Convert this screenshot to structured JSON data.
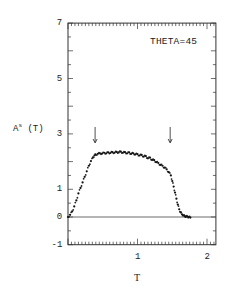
{
  "chart_data": {
    "type": "scatter",
    "title": "",
    "annotation": "THETA=45",
    "xlabel": "T",
    "ylabel": "A^s (T)",
    "ylabel_base": "A",
    "ylabel_sup": "s",
    "ylabel_arg": " (T)",
    "xlim": [
      0,
      2.2
    ],
    "ylim": [
      -1,
      7
    ],
    "xticks": [
      1,
      2
    ],
    "xtick_labels": [
      "1",
      "2"
    ],
    "yticks": [
      -1,
      0,
      1,
      3,
      5,
      7
    ],
    "ytick_labels": [
      "-1",
      "0",
      "1",
      "3",
      "5",
      "7"
    ],
    "x_minor_step": 0.05,
    "y_minor_step": 0.5,
    "grid": false,
    "reference_line_y": 0,
    "arrows_at_x": [
      0.39,
      1.47
    ],
    "series": [
      {
        "name": "A^s(T)",
        "marker": "dot",
        "x": [
          0.0,
          0.03,
          0.06,
          0.09,
          0.12,
          0.15,
          0.18,
          0.21,
          0.24,
          0.27,
          0.3,
          0.33,
          0.36,
          0.38,
          0.4,
          0.43,
          0.46,
          0.49,
          0.52,
          0.55,
          0.58,
          0.61,
          0.64,
          0.67,
          0.7,
          0.73,
          0.76,
          0.79,
          0.82,
          0.85,
          0.88,
          0.91,
          0.94,
          0.97,
          1.0,
          1.03,
          1.06,
          1.09,
          1.12,
          1.15,
          1.18,
          1.21,
          1.24,
          1.27,
          1.3,
          1.33,
          1.36,
          1.39,
          1.42,
          1.45,
          1.48,
          1.5,
          1.52,
          1.54,
          1.56,
          1.58,
          1.6,
          1.62,
          1.64,
          1.66,
          1.68,
          1.7,
          1.72,
          1.74,
          1.76
        ],
        "y": [
          0.0,
          0.08,
          0.2,
          0.38,
          0.6,
          0.85,
          1.05,
          1.25,
          1.45,
          1.65,
          1.85,
          2.02,
          2.15,
          2.22,
          2.25,
          2.28,
          2.3,
          2.29,
          2.32,
          2.3,
          2.33,
          2.31,
          2.34,
          2.32,
          2.35,
          2.33,
          2.36,
          2.32,
          2.34,
          2.3,
          2.33,
          2.28,
          2.3,
          2.26,
          2.27,
          2.22,
          2.24,
          2.18,
          2.2,
          2.12,
          2.14,
          2.06,
          2.05,
          1.98,
          1.95,
          1.88,
          1.85,
          1.78,
          1.72,
          1.62,
          1.5,
          1.3,
          1.1,
          0.88,
          0.66,
          0.45,
          0.28,
          0.17,
          0.1,
          0.06,
          0.03,
          0.02,
          0.01,
          0.0,
          -0.02
        ]
      }
    ]
  }
}
